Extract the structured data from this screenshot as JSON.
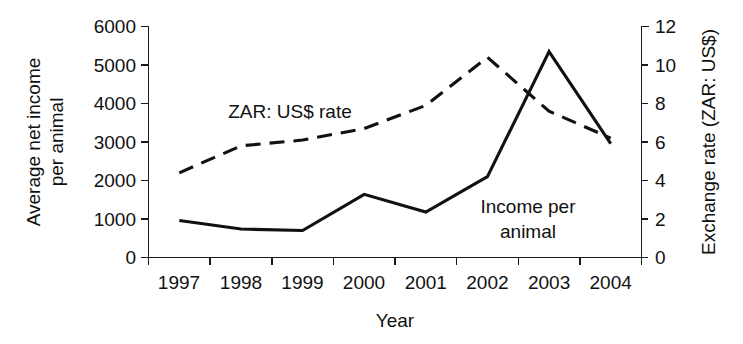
{
  "chart_data": {
    "type": "line",
    "title": "",
    "xlabel": "Year",
    "categories": [
      "1997",
      "1998",
      "1999",
      "2000",
      "2001",
      "2002",
      "2003",
      "2004"
    ],
    "x": [
      1997,
      1998,
      1999,
      2000,
      2001,
      2002,
      2003,
      2004
    ],
    "grid": false,
    "legend_position": "inline-annotations",
    "axes": {
      "left": {
        "label_line1": "Average net income",
        "label_line2": "per animal",
        "ylim": [
          0,
          6000
        ],
        "tick_step": 1000,
        "ticks": [
          "0",
          "1000",
          "2000",
          "3000",
          "4000",
          "5000",
          "6000"
        ],
        "tick_values": [
          0,
          1000,
          2000,
          3000,
          4000,
          5000,
          6000
        ]
      },
      "right": {
        "label": "Exchange rate (ZAR: US$)",
        "ylim": [
          0,
          12
        ],
        "tick_step": 2,
        "ticks": [
          "0",
          "2",
          "4",
          "6",
          "8",
          "10",
          "12"
        ],
        "tick_values": [
          0,
          2,
          4,
          6,
          8,
          10,
          12
        ]
      },
      "bottom": {
        "label": "Year",
        "ticks": [
          "1997",
          "1998",
          "1999",
          "2000",
          "2001",
          "2002",
          "2003",
          "2004"
        ]
      }
    },
    "series": [
      {
        "name": "Income per animal",
        "annotation_line1": "Income per",
        "annotation_line2": "animal",
        "axis": "left",
        "style": "solid",
        "color": "#111111",
        "values": [
          960,
          740,
          700,
          1640,
          1180,
          2100,
          5350,
          2960
        ]
      },
      {
        "name": "ZAR: US$ rate",
        "annotation_line1": "ZAR: US$ rate",
        "annotation_line2": "",
        "axis": "right",
        "style": "dashed",
        "color": "#111111",
        "values": [
          4.4,
          5.8,
          6.1,
          6.7,
          7.9,
          10.4,
          7.6,
          6.2
        ]
      }
    ]
  },
  "annotations": {
    "zar_rate_label": "ZAR: US$ rate",
    "income_label_line1": "Income per",
    "income_label_line2": "animal"
  },
  "colors": {
    "background": "#ffffff",
    "ink": "#111111"
  }
}
